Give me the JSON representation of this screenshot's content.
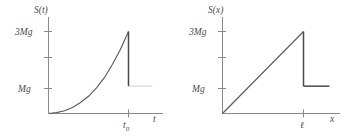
{
  "figure": {
    "panels": [
      {
        "id": "left",
        "yaxis_label": "S(t)",
        "xaxis_label": "t",
        "ytick_labels": [
          "3Mg",
          "",
          "Mg"
        ],
        "xtick_label_base": "t",
        "xtick_label_sub": "0",
        "curve_description": "exponential rise then vertical drop"
      },
      {
        "id": "right",
        "yaxis_label": "S(x)",
        "xaxis_label": "x",
        "ytick_labels": [
          "3Mg",
          "",
          "Mg"
        ],
        "xtick_label_base": "ℓ",
        "xtick_label_sub": "",
        "curve_description": "linear rise then vertical drop then constant"
      }
    ],
    "colors": {
      "axis": "#8a8a8a",
      "curve": "#5a5a5a",
      "curve_thick": "#4a4a4a",
      "faint": "#d8d8d8",
      "text": "#4a4a4a",
      "background": "#ffffff"
    }
  },
  "chart_data": [
    {
      "type": "line",
      "title": "",
      "xlabel": "t",
      "ylabel": "S(t)",
      "xlim": [
        0,
        1.35
      ],
      "ylim": [
        0,
        3.55
      ],
      "xticks": [
        1.0
      ],
      "xticklabels": [
        "t0"
      ],
      "yticks": [
        1,
        2,
        3
      ],
      "yticklabels": [
        "Mg",
        "",
        "3Mg"
      ],
      "grid": false,
      "legend": false,
      "series": [
        {
          "name": "S(t) rise",
          "x": [
            0.0,
            0.1,
            0.2,
            0.3,
            0.4,
            0.5,
            0.6,
            0.7,
            0.8,
            0.9,
            1.0
          ],
          "y": [
            0.0,
            0.03,
            0.1,
            0.22,
            0.4,
            0.63,
            0.94,
            1.32,
            1.8,
            2.35,
            3.0
          ]
        },
        {
          "name": "S(t) drop",
          "x": [
            1.0,
            1.0
          ],
          "y": [
            3.0,
            1.0
          ]
        },
        {
          "name": "S(t) tail (faint)",
          "x": [
            1.0,
            1.3
          ],
          "y": [
            1.0,
            1.0
          ]
        }
      ]
    },
    {
      "type": "line",
      "title": "",
      "xlabel": "x",
      "ylabel": "S(x)",
      "xlim": [
        0,
        1.35
      ],
      "ylim": [
        0,
        3.55
      ],
      "xticks": [
        1.0
      ],
      "xticklabels": [
        "ℓ"
      ],
      "yticks": [
        1,
        2,
        3
      ],
      "yticklabels": [
        "Mg",
        "",
        "3Mg"
      ],
      "grid": false,
      "legend": false,
      "series": [
        {
          "name": "S(x) rise",
          "x": [
            0.0,
            1.0
          ],
          "y": [
            0.0,
            3.0
          ]
        },
        {
          "name": "S(x) drop",
          "x": [
            1.0,
            1.0
          ],
          "y": [
            3.0,
            1.0
          ]
        },
        {
          "name": "S(x) tail",
          "x": [
            1.0,
            1.32
          ],
          "y": [
            1.0,
            1.0
          ]
        }
      ]
    }
  ]
}
